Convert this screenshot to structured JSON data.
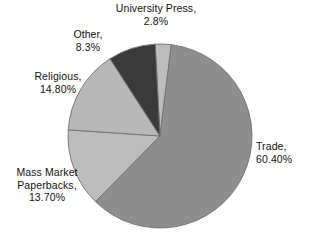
{
  "chart_data": {
    "type": "pie",
    "title": "",
    "subtitle": "",
    "xlabel": "",
    "ylabel": "",
    "legend_position": "none",
    "grid": false,
    "labels_position": "outside",
    "start_angle_deg": -3,
    "direction": "clockwise",
    "categories": [
      "University Press",
      "Trade",
      "Mass Market Paperbacks",
      "Religious",
      "Other"
    ],
    "values": [
      2.8,
      60.4,
      13.7,
      14.8,
      8.3
    ],
    "value_texts": [
      "2.8%",
      "60.40%",
      "13.70%",
      "14.80%",
      "8.3%"
    ],
    "slices": [
      {
        "name": "University Press",
        "value": 2.8,
        "value_text": "2.8%",
        "color": "#bdbdbd",
        "label_lines": [
          "University Press,",
          "2.8%"
        ]
      },
      {
        "name": "Trade",
        "value": 60.4,
        "value_text": "60.40%",
        "color": "#8e8e8e",
        "label_lines": [
          "Trade,",
          "60.40%"
        ]
      },
      {
        "name": "Mass Market Paperbacks",
        "value": 13.7,
        "value_text": "13.70%",
        "color": "#bdbdbd",
        "label_lines": [
          "Mass Market",
          "Paperbacks,",
          "13.70%"
        ]
      },
      {
        "name": "Religious",
        "value": 14.8,
        "value_text": "14.80%",
        "color": "#b8b8b8",
        "label_lines": [
          "Religious,",
          "14.80%"
        ]
      },
      {
        "name": "Other",
        "value": 8.3,
        "value_text": "8.3%",
        "color": "#3a3a3a",
        "label_lines": [
          "Other,",
          "8.3%"
        ]
      }
    ]
  },
  "labels": {
    "university_press": "University Press,\n2.8%",
    "trade": "Trade,\n60.40%",
    "mass_market": "Mass Market\nPaperbacks,\n13.70%",
    "religious": "Religious,\n14.80%",
    "other": "Other,\n8.3%"
  },
  "colors": {
    "background": "#ffffff",
    "outline": "#6f6f6f",
    "text": "#111111",
    "trade": "#8e8e8e",
    "university_press": "#bdbdbd",
    "mass_market": "#bdbdbd",
    "religious": "#b8b8b8",
    "other": "#3a3a3a"
  },
  "geometry": {
    "center_x": 160,
    "center_y": 136,
    "radius": 92
  }
}
